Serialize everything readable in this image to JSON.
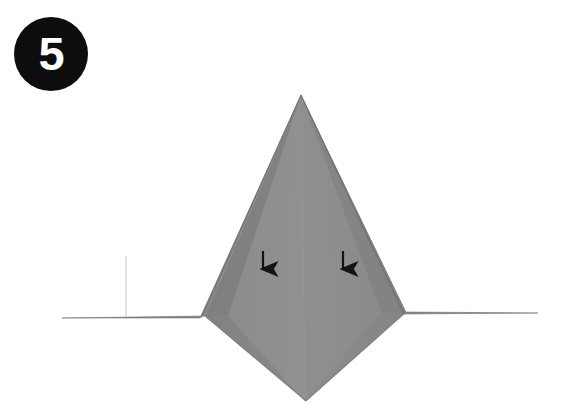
{
  "diagram": {
    "kind": "origami-fold-step",
    "background_color": "#ffffff",
    "step": {
      "number": "5",
      "badge_fill": "#0d0d0d",
      "badge_text_color": "#ffffff"
    },
    "paper": {
      "base_color": "#8a8a8a",
      "light_panel_color": "#909090",
      "mid_panel_color": "#858585",
      "dark_panel_color": "#7b7b7b",
      "shadow_edge_color": "#6f6f6f",
      "crease_line_color": "#a6a6a6",
      "outline_color": "#6d6d6d"
    },
    "model": {
      "apex": {
        "x": 301,
        "y": 95
      },
      "left_wing_tip": {
        "x": 62,
        "y": 318
      },
      "right_wing_tip": {
        "x": 538,
        "y": 313
      },
      "bottom_point": {
        "x": 306,
        "y": 401
      },
      "left_notch": {
        "x": 205,
        "y": 316
      },
      "right_notch": {
        "x": 406,
        "y": 312
      },
      "left_flap_edge_bottom": {
        "x": 200,
        "y": 318
      },
      "right_flap_edge_bottom": {
        "x": 404,
        "y": 314
      },
      "center_crease_bottom": {
        "x": 304,
        "y": 340
      }
    },
    "creases": [
      {
        "name": "center-vertical-crease",
        "from": {
          "x": 301,
          "y": 95
        },
        "to": {
          "x": 305,
          "y": 401
        }
      },
      {
        "name": "left-flap-crease",
        "from": {
          "x": 301,
          "y": 95
        },
        "to": {
          "x": 201,
          "y": 318
        }
      },
      {
        "name": "right-flap-crease",
        "from": {
          "x": 301,
          "y": 95
        },
        "to": {
          "x": 404,
          "y": 314
        }
      },
      {
        "name": "left-wing-vertical-crease",
        "from": {
          "x": 126,
          "y": 254
        },
        "to": {
          "x": 126,
          "y": 320
        }
      }
    ],
    "arrows": [
      {
        "name": "left-fold-arrow",
        "direction": "down",
        "x": 263,
        "y": 251,
        "length": 23,
        "color": "#141414"
      },
      {
        "name": "right-fold-arrow",
        "direction": "down",
        "x": 343,
        "y": 251,
        "length": 23,
        "color": "#141414"
      }
    ]
  }
}
